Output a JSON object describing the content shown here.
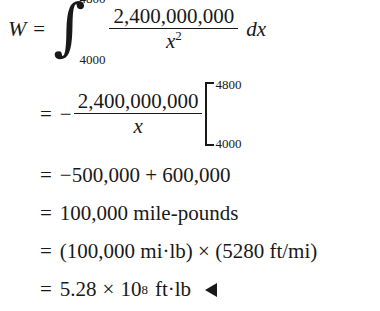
{
  "document": {
    "type": "math-worked-solution",
    "variable": "W",
    "lines": [
      {
        "id": "line1",
        "lhs": "W",
        "relation": "=",
        "integral": {
          "symbol": "∫",
          "lower_limit": "4000",
          "upper_limit": "4800",
          "numerator": "2,400,000,000",
          "denominator_base": "x",
          "denominator_exponent": "2",
          "differential": "dx"
        }
      },
      {
        "id": "line2",
        "relation": "=",
        "sign": "−",
        "numerator": "2,400,000,000",
        "denominator": "x",
        "eval_lower_limit": "4000",
        "eval_upper_limit": "4800"
      },
      {
        "id": "line3",
        "relation": "=",
        "text": "−500,000 + 600,000"
      },
      {
        "id": "line4",
        "relation": "=",
        "text": "100,000 mile-pounds"
      },
      {
        "id": "line5",
        "relation": "=",
        "text": "(100,000 mi·lb) × (5280 ft/mi)",
        "clipped_right": true
      },
      {
        "id": "line6",
        "relation": "=",
        "mantissa": "5.28",
        "times": "×",
        "base": "10",
        "exponent": "8",
        "units": "ft·lb",
        "end_marker": "◀"
      }
    ]
  },
  "colors": {
    "background": "#ffffff",
    "ink": "#191919"
  }
}
